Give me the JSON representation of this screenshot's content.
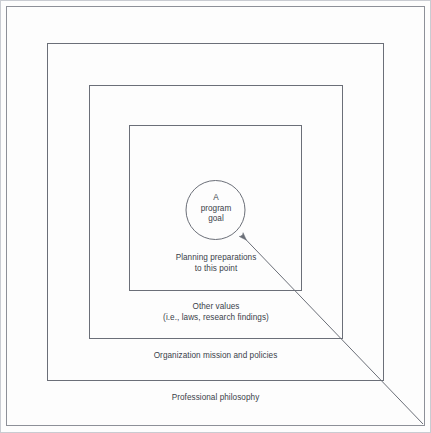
{
  "diagram": {
    "center": {
      "shape": "circle",
      "lines": [
        "A",
        "program",
        "goal"
      ]
    },
    "rings": [
      {
        "id": "planning-preparations",
        "lines": [
          "Planning preparations",
          "to this point"
        ]
      },
      {
        "id": "other-values",
        "lines": [
          "Other values",
          "(i.e., laws, research findings)"
        ]
      },
      {
        "id": "organization-mission",
        "lines": [
          "Organization mission and policies"
        ]
      },
      {
        "id": "professional-philosophy",
        "lines": [
          "Professional philosophy"
        ]
      }
    ],
    "annotation": {
      "id": "pointer-arrow",
      "description": "Arrow from outer bottom-right corner to the program goal circle"
    },
    "colors": {
      "stroke": "#6b6f78",
      "text": "#3b3f4a",
      "background": "#fdfdfd",
      "outer_border": "#8d9098"
    }
  }
}
